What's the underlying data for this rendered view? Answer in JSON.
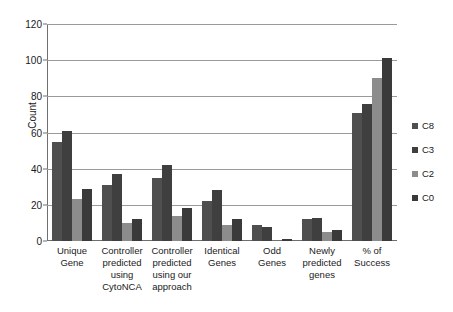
{
  "chart_data": {
    "type": "bar",
    "title": "",
    "xlabel": "",
    "ylabel": "Count",
    "ylim": [
      0,
      120
    ],
    "ytick_step": 20,
    "yticks": [
      120,
      100,
      80,
      60,
      40,
      20,
      0
    ],
    "grid": "horizontal",
    "legend_position": "right",
    "categories": [
      "Unique Gene",
      "Controller predicted using CytoNCA",
      "Controller predicted using our approach",
      "Identical Genes",
      "Odd Genes",
      "Newly predicted genes",
      "% of Success"
    ],
    "category_lines": [
      [
        "Unique",
        "Gene"
      ],
      [
        "Controller",
        "predicted",
        "using",
        "CytoNCA"
      ],
      [
        "Controller",
        "predicted",
        "using our",
        "approach"
      ],
      [
        "Identical",
        "Genes"
      ],
      [
        "Odd Genes"
      ],
      [
        "Newly",
        "predicted",
        "genes"
      ],
      [
        "% of",
        "Success"
      ]
    ],
    "series": [
      {
        "name": "C8",
        "color": "#4f4f4f",
        "values": [
          55,
          31,
          35,
          22,
          9,
          12,
          71
        ]
      },
      {
        "name": "C3",
        "color": "#3f3f3f",
        "values": [
          61,
          37,
          42,
          28,
          8,
          13,
          76
        ]
      },
      {
        "name": "C2",
        "color": "#8c8c8c",
        "values": [
          23,
          10,
          14,
          9,
          0,
          5,
          90
        ]
      },
      {
        "name": "C0",
        "color": "#3a3a3a",
        "values": [
          29,
          12,
          18,
          12,
          1,
          6,
          101
        ]
      }
    ]
  }
}
